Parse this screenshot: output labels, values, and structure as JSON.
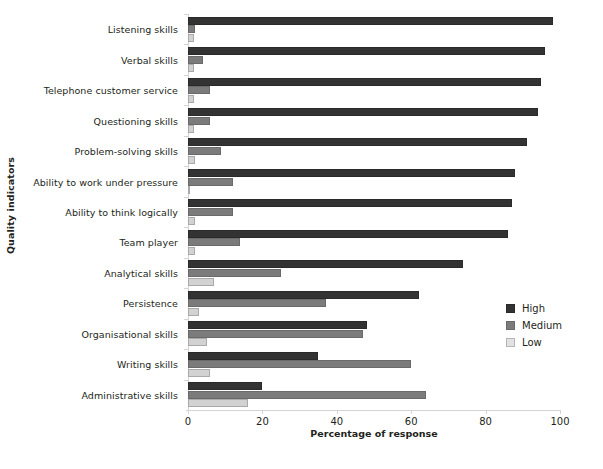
{
  "chart_data": {
    "type": "bar",
    "orientation": "horizontal",
    "title": "",
    "xlabel": "Percentage of response",
    "ylabel": "Quality indicators",
    "xlim": [
      0,
      100
    ],
    "xticks": [
      0,
      20,
      40,
      60,
      80,
      100
    ],
    "grid": false,
    "legend_position": "right",
    "categories": [
      "Listening skills",
      "Verbal skills",
      "Telephone customer service",
      "Questioning skills",
      "Problem-solving skills",
      "Ability to work under pressure",
      "Ability to think logically",
      "Team player",
      "Analytical skills",
      "Persistence",
      "Organisational skills",
      "Writing skills",
      "Administrative skills"
    ],
    "series": [
      {
        "name": "High",
        "color": "#333333",
        "values": [
          98,
          96,
          95,
          94,
          91,
          88,
          87,
          86,
          74,
          62,
          48,
          35,
          20
        ]
      },
      {
        "name": "Medium",
        "color": "#7b7b7b",
        "values": [
          2,
          4,
          6,
          6,
          9,
          12,
          12,
          14,
          25,
          37,
          47,
          60,
          64
        ]
      },
      {
        "name": "Low",
        "color": "#d2d2d2",
        "values": [
          1.5,
          1.5,
          1.5,
          1.5,
          2,
          0,
          2,
          2,
          7,
          3,
          5,
          6,
          16
        ]
      }
    ]
  },
  "legend": {
    "entries": [
      {
        "label": "High",
        "swatch": "high"
      },
      {
        "label": "Medium",
        "swatch": "medium"
      },
      {
        "label": "Low",
        "swatch": "low"
      }
    ]
  }
}
